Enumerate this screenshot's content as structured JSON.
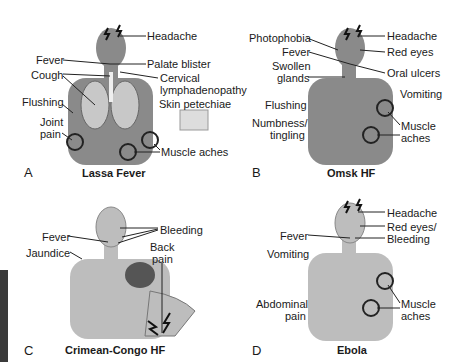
{
  "colors": {
    "skin_dark": "#8a8a8a",
    "skin_light": "#bdbdbd",
    "line": "#1a1a1a",
    "sidebar": "#3a3a3a"
  },
  "panels": {
    "A": {
      "letter": "A",
      "title": "Lassa Fever",
      "labels": {
        "headache": "Headache",
        "fever": "Fever",
        "palate": "Palate blister",
        "cough": "Cough",
        "cervical1": "Cervical",
        "cervical2": "lymphadenopathy",
        "flushing": "Flushing",
        "skin": "Skin petechiae",
        "joint1": "Joint",
        "joint2": "pain",
        "muscle": "Muscle aches"
      }
    },
    "B": {
      "letter": "B",
      "title": "Omsk HF",
      "labels": {
        "photophobia": "Photophobia",
        "headache": "Headache",
        "fever": "Fever",
        "redeyes": "Red eyes",
        "swollen1": "Swollen",
        "swollen2": "glands",
        "oral": "Oral ulcers",
        "vomiting": "Vomiting",
        "flushing": "Flushing",
        "numb1": "Numbness/",
        "numb2": "tingling",
        "muscle1": "Muscle",
        "muscle2": "aches"
      }
    },
    "C": {
      "letter": "C",
      "title": "Crimean-Congo HF",
      "labels": {
        "fever": "Fever",
        "bleeding": "Bleeding",
        "jaundice": "Jaundice",
        "back1": "Back",
        "back2": "pain"
      }
    },
    "D": {
      "letter": "D",
      "title": "Ebola",
      "labels": {
        "headache": "Headache",
        "fever": "Fever",
        "redeyes": "Red eyes/",
        "bleeding": "Bleeding",
        "vomiting": "Vomiting",
        "abd1": "Abdominal",
        "abd2": "pain",
        "muscle1": "Muscle",
        "muscle2": "aches"
      }
    }
  }
}
